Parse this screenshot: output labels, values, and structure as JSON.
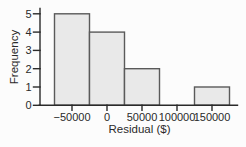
{
  "chart_data": {
    "type": "bar",
    "subtype": "histogram",
    "title": "",
    "xlabel": "Residual ($)",
    "ylabel": "Frequency",
    "bin_width": 50000,
    "bin_centers": [
      -50000,
      0,
      50000,
      100000,
      150000
    ],
    "frequencies": [
      5,
      4,
      2,
      0,
      1
    ],
    "x_tick_labels": [
      "−50000",
      "0",
      "50000",
      "100000",
      "150000"
    ],
    "y_ticks": [
      0,
      1,
      2,
      3,
      4,
      5
    ],
    "xlim": [
      -95000,
      185000
    ],
    "ylim": [
      0,
      5
    ],
    "grid": "off",
    "legend": "none",
    "bar_fill": "#e9e9e9",
    "bar_stroke": "#5a5a5a",
    "axis_color": "#2a2a2a",
    "text_color": "#2a2a2a",
    "background": "#fcfcfc"
  }
}
